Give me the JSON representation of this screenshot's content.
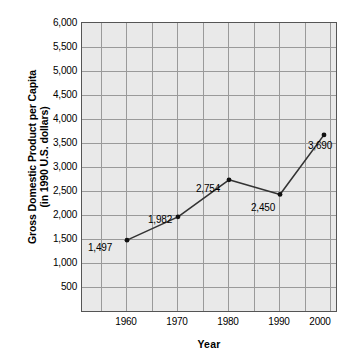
{
  "chart_data": {
    "type": "line",
    "title": "",
    "xlabel": "Year",
    "ylabel": "Gross Domestic Product per Capita (in 1990 U.S. dollars)",
    "ylabel_line1": "Gross Domestic Product per Capita",
    "ylabel_line2": "(in 1990 U.S. dollars)",
    "categories": [
      "1960",
      "1970",
      "1980",
      "1990",
      "2000"
    ],
    "x": [
      1960,
      1970,
      1980,
      1990,
      2000
    ],
    "values": [
      1497,
      1982,
      2754,
      2450,
      3690
    ],
    "point_labels": [
      "1,497",
      "1,982",
      "2,754",
      "2,450",
      "3,690"
    ],
    "series": [
      {
        "name": "Gross Domestic Product per Capita",
        "values": [
          1497,
          1982,
          2754,
          2450,
          3690
        ]
      }
    ],
    "ylim": [
      0,
      6000
    ],
    "ytick_step": 500,
    "ytick_labels": [
      "6,000",
      "5,500",
      "5,000",
      "4,500",
      "4,000",
      "3,500",
      "3,000",
      "2,500",
      "2,000",
      "1,500",
      "1,000",
      "500"
    ],
    "ytick_values": [
      6000,
      5500,
      5000,
      4500,
      4000,
      3500,
      3000,
      2500,
      2000,
      1500,
      1000,
      500
    ],
    "xtick_labels": [
      "1960",
      "1970",
      "1980",
      "1990",
      "2000"
    ],
    "grid": true,
    "legend": "none",
    "colors": {
      "plot_background": "#e9e9e9",
      "gridline": "#9a9a9a",
      "plot_border": "#555555",
      "series_line": "#333333",
      "marker": "#111111",
      "text": "#000000",
      "page_background": "#ffffff"
    }
  }
}
